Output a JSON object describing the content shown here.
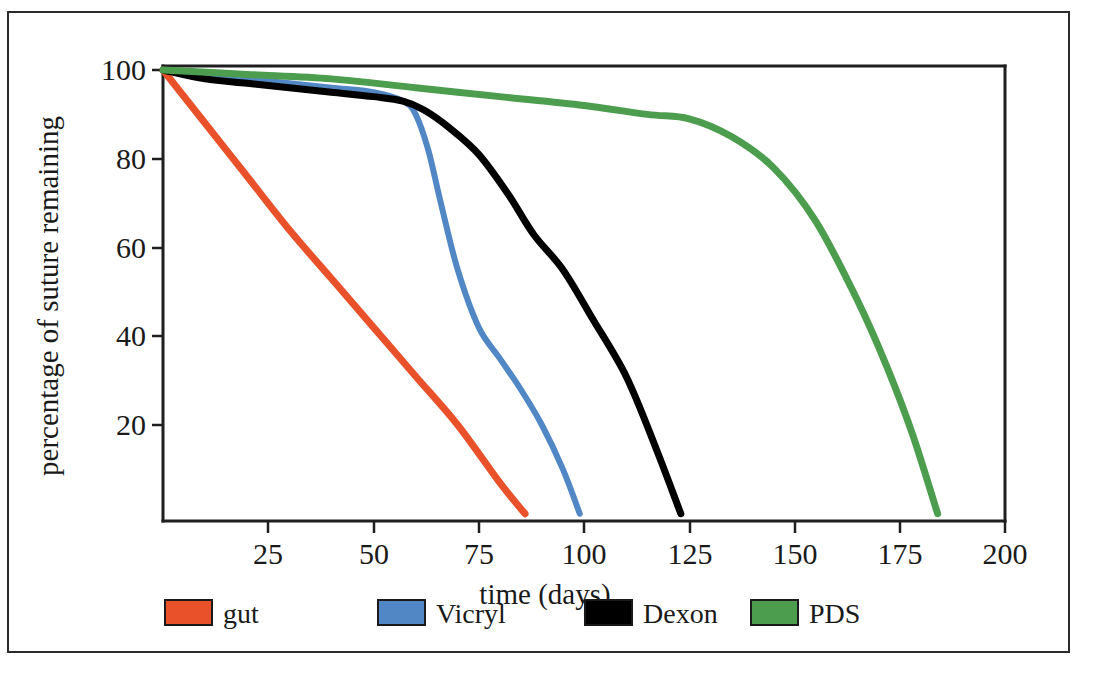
{
  "figure": {
    "border_color": "#2b2b2b",
    "background": "#ffffff"
  },
  "chart_data": {
    "type": "line",
    "title": "",
    "subtitle": "",
    "xlabel": "time (days)",
    "ylabel": "percentage of suture remaining",
    "xlim": [
      0,
      200
    ],
    "ylim": [
      0,
      100
    ],
    "xticks": [
      25,
      50,
      75,
      100,
      125,
      150,
      175,
      200
    ],
    "xtick_labels": [
      "25",
      "50",
      "75",
      "100",
      "125",
      "150",
      "175",
      "200"
    ],
    "yticks": [
      20,
      40,
      60,
      80,
      100
    ],
    "ytick_labels": [
      "20",
      "40",
      "60",
      "80",
      "100"
    ],
    "grid": false,
    "legend_position": "below-axes",
    "series": [
      {
        "name": "gut",
        "color": "#E8512A",
        "x": [
          0,
          10,
          20,
          30,
          40,
          50,
          60,
          70,
          80,
          86
        ],
        "values": [
          100,
          88,
          76,
          64,
          53,
          42,
          31,
          20,
          7,
          0
        ]
      },
      {
        "name": "Vicryl",
        "color": "#5187C4",
        "x": [
          0,
          10,
          20,
          30,
          40,
          50,
          57,
          60,
          63,
          66,
          70,
          75,
          80,
          85,
          90,
          95,
          99
        ],
        "values": [
          100,
          99,
          98,
          97,
          96,
          95,
          93,
          90,
          82,
          70,
          55,
          42,
          35,
          28,
          20,
          10,
          0
        ]
      },
      {
        "name": "Dexon",
        "color": "#000000",
        "x": [
          0,
          10,
          20,
          30,
          40,
          50,
          57,
          62,
          68,
          75,
          82,
          88,
          95,
          102,
          110,
          117,
          123
        ],
        "values": [
          100,
          98,
          97,
          96,
          95,
          94,
          93,
          91,
          87,
          81,
          72,
          63,
          55,
          44,
          31,
          15,
          0
        ]
      },
      {
        "name": "PDS",
        "color": "#4C9E4E",
        "x": [
          0,
          20,
          40,
          60,
          80,
          100,
          115,
          125,
          135,
          145,
          155,
          165,
          172,
          178,
          184
        ],
        "values": [
          100,
          99,
          98,
          96,
          94,
          92,
          90,
          89,
          85,
          78,
          66,
          48,
          33,
          18,
          0
        ]
      }
    ]
  },
  "legend": {
    "items": [
      {
        "label": "gut",
        "color": "#E8512A"
      },
      {
        "label": "Vicryl",
        "color": "#5187C4"
      },
      {
        "label": "Dexon",
        "color": "#000000"
      },
      {
        "label": "PDS",
        "color": "#4C9E4E"
      }
    ]
  }
}
